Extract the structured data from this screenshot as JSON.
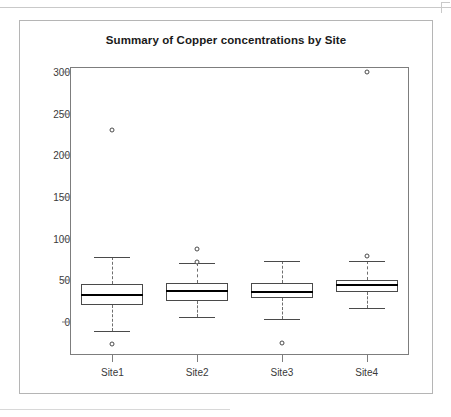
{
  "figure": {
    "title": "Summary of Copper concentrations by Site"
  },
  "chart_data": {
    "type": "box",
    "title": "Summary of Copper concentrations by Site",
    "xlabel": "",
    "ylabel": "",
    "categories": [
      "Site1",
      "Site2",
      "Site3",
      "Site4"
    ],
    "ylim": [
      -40,
      310
    ],
    "yticks": [
      0,
      50,
      100,
      150,
      200,
      250,
      300
    ],
    "ytick_labels": [
      "0",
      "50",
      "100",
      "150",
      "200",
      "250",
      "300"
    ],
    "grid": false,
    "legend": "none",
    "boxes": [
      {
        "name": "Site1",
        "whisker_low": -11,
        "q1": 20,
        "median": 32,
        "q3": 46,
        "whisker_high": 78,
        "outliers": [
          230,
          -26
        ]
      },
      {
        "name": "Site2",
        "whisker_low": 6,
        "q1": 25,
        "median": 37,
        "q3": 47,
        "whisker_high": 71,
        "outliers": [
          88,
          72
        ]
      },
      {
        "name": "Site3",
        "whisker_low": 4,
        "q1": 29,
        "median": 36,
        "q3": 47,
        "whisker_high": 73,
        "outliers": [
          -25
        ]
      },
      {
        "name": "Site4",
        "whisker_low": 17,
        "q1": 36,
        "median": 44,
        "q3": 50,
        "whisker_high": 73,
        "outliers": [
          300,
          79
        ]
      }
    ]
  },
  "colors": {
    "box_stroke": "#4a4a4a",
    "median": "#000000",
    "whisker": "#6e6e6e",
    "axis": "#7d7d7d",
    "frame": "#b5b5b5",
    "text": "#3a3a3a"
  }
}
